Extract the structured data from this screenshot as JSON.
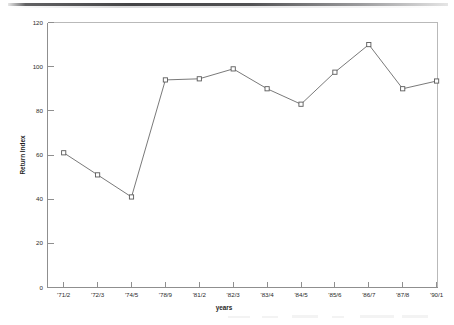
{
  "figure": {
    "background_color": "#ffffff",
    "line_color": "#6a6a6a",
    "marker_color": "#5a5a5a",
    "axis_color": "#8f8f8f",
    "frame_color": "#b9b9b9"
  },
  "chart_data": {
    "type": "line",
    "title": "",
    "xlabel": "years",
    "ylabel": "Return Index",
    "categories": [
      "'71/2",
      "'72/3",
      "'74/5",
      "'78/9",
      "'81/2",
      "'82/3",
      "'83/4",
      "'84/5",
      "'85/6",
      "'86/7",
      "'87/8",
      "'90/1"
    ],
    "values": [
      61,
      51,
      41,
      94,
      94.5,
      99,
      90,
      83,
      97.5,
      110,
      90,
      93.5
    ],
    "series": [
      {
        "name": "Return Index",
        "values": [
          61,
          51,
          41,
          94,
          94.5,
          99,
          90,
          83,
          97.5,
          110,
          90,
          93.5
        ]
      }
    ],
    "ylim": [
      0,
      120
    ],
    "ytick_labels": [
      "0",
      "20",
      "40",
      "60",
      "80",
      "100",
      "120"
    ],
    "yticks": [
      0,
      20,
      40,
      60,
      80,
      100,
      120
    ],
    "xtick_labels": [
      "'71/2",
      "'72/3",
      "'74/5",
      "'78/9",
      "'81/2",
      "'82/3",
      "'83/4",
      "'84/5",
      "'85/6",
      "'86/7",
      "'87/8",
      "'90/1"
    ],
    "grid": false,
    "legend": null,
    "legend_position": "none",
    "marker_style": "open-square",
    "annotations": []
  },
  "axes": {
    "y_title": "Return Index",
    "x_title": "years"
  }
}
